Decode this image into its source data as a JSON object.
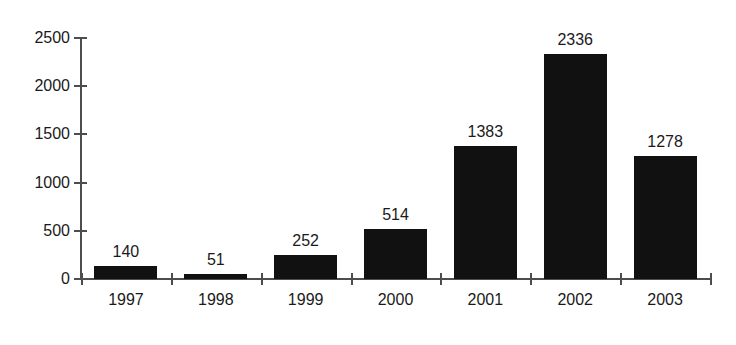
{
  "chart_data": {
    "type": "bar",
    "title": "",
    "subtitle": "",
    "xlabel": "",
    "ylabel": "",
    "categories": [
      "1997",
      "1998",
      "1999",
      "2000",
      "2001",
      "2002",
      "2003"
    ],
    "values": [
      140,
      51,
      252,
      514,
      1383,
      2336,
      1278
    ],
    "value_labels": [
      "140",
      "51",
      "252",
      "514",
      "1383",
      "2336",
      "1278"
    ],
    "ylim": [
      0,
      2500
    ],
    "yticks": [
      0,
      500,
      1000,
      1500,
      2000,
      2500
    ],
    "ytick_labels": [
      "0",
      "500",
      "1000",
      "1500",
      "2000",
      "2500"
    ],
    "grid": false,
    "legend": null,
    "legend_position": "none",
    "bar_color": "#111111",
    "axis_color": "#4d4d4d",
    "text_color": "#1a1a1a",
    "background_color": "#ffffff",
    "annotations": []
  }
}
